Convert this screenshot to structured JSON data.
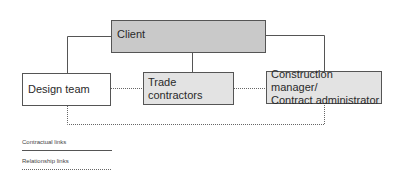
{
  "diagram": {
    "nodes": {
      "client": {
        "label": "Client"
      },
      "design_team": {
        "label": "Design team"
      },
      "trade_contractors": {
        "label": "Trade contractors"
      },
      "construction_manager": {
        "line1": "Construction manager/",
        "line2": "Contract administrator"
      }
    },
    "edges": [
      {
        "from": "Client",
        "to": "Design team",
        "type": "contractual"
      },
      {
        "from": "Client",
        "to": "Trade contractors",
        "type": "contractual"
      },
      {
        "from": "Client",
        "to": "Construction manager/Contract administrator",
        "type": "contractual"
      },
      {
        "from": "Design team",
        "to": "Trade contractors",
        "type": "relationship"
      },
      {
        "from": "Trade contractors",
        "to": "Construction manager/Contract administrator",
        "type": "relationship"
      },
      {
        "from": "Design team",
        "to": "Construction manager/Contract administrator",
        "type": "relationship"
      }
    ],
    "legend": {
      "contractual": "Contractual links",
      "relationship": "Relationship links"
    },
    "colors": {
      "client_fill": "#c9c9c9",
      "secondary_fill": "#e3e3e3",
      "design_fill": "#ffffff",
      "line": "#555555"
    }
  }
}
